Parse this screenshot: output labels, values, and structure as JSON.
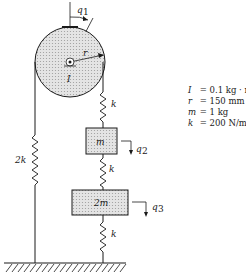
{
  "diagram": {
    "type": "mass-spring-pulley system",
    "labels": {
      "angle_coord": "q",
      "angle_sub": "1",
      "radius": "r",
      "inertia": "I",
      "spring_top": "k",
      "spring_mid": "k",
      "spring_bottom": "k",
      "spring_left": "2k",
      "mass_upper": "m",
      "mass_lower": "2m",
      "coord_q2": "q",
      "coord_q2_sub": "2",
      "coord_q3": "q",
      "coord_q3_sub": "3"
    },
    "parameters": [
      {
        "symbol": "I",
        "value": "= 0.1 kg · m²"
      },
      {
        "symbol": "r",
        "value": "= 150 mm"
      },
      {
        "symbol": "m",
        "value": "= 1 kg"
      },
      {
        "symbol": "k",
        "value": "= 200 N/m"
      }
    ],
    "colors": {
      "line": "#1a1a1a",
      "fill_shade": "#d9d9d9",
      "background": "#ffffff"
    }
  }
}
